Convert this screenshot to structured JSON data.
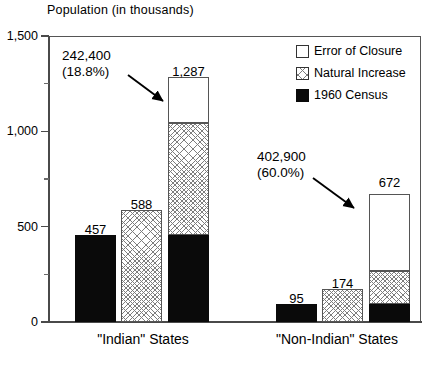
{
  "chart_data": {
    "type": "bar",
    "title": "Population (in thousands)",
    "xlabel": "",
    "ylabel": "Population (in thousands)",
    "ylim": [
      0,
      1500
    ],
    "yticks": [
      0,
      500,
      1000,
      1500
    ],
    "ytick_labels": [
      "0",
      "500",
      "1,000",
      "1,500"
    ],
    "yminor_ticks": [
      250,
      750,
      1250
    ],
    "grid": false,
    "legend_position": "top-right",
    "categories": [
      "\"Indian\" States",
      "\"Non-Indian\" States"
    ],
    "legend": [
      {
        "label": "Error of Closure",
        "pattern": "white"
      },
      {
        "label": "Natural Increase",
        "pattern": "crosshatch"
      },
      {
        "label": "1960 Census",
        "pattern": "black"
      }
    ],
    "groups": [
      {
        "category": "\"Indian\" States",
        "bars": [
          {
            "name": "1960 Census",
            "value": 457,
            "label": "457",
            "pattern": "black"
          },
          {
            "name": "Natural Increase",
            "value": 588,
            "label": "588",
            "pattern": "crosshatch"
          },
          {
            "name": "Stacked Total",
            "value": 1287,
            "label": "1,287",
            "pattern": "stacked",
            "segments": [
              {
                "name": "1960 Census",
                "value": 457,
                "pattern": "black"
              },
              {
                "name": "Natural Increase",
                "value": 588,
                "pattern": "crosshatch"
              },
              {
                "name": "Error of Closure",
                "value": 242,
                "pattern": "white"
              }
            ]
          }
        ],
        "annotation": {
          "line1": "242,400",
          "line2": "(18.8%)",
          "points_to": "Error of Closure"
        }
      },
      {
        "category": "\"Non-Indian\" States",
        "bars": [
          {
            "name": "1960 Census",
            "value": 95,
            "label": "95",
            "pattern": "black"
          },
          {
            "name": "Natural Increase",
            "value": 174,
            "label": "174",
            "pattern": "crosshatch"
          },
          {
            "name": "Stacked Total",
            "value": 672,
            "label": "672",
            "pattern": "stacked",
            "segments": [
              {
                "name": "1960 Census",
                "value": 95,
                "pattern": "black"
              },
              {
                "name": "Natural Increase",
                "value": 174,
                "pattern": "crosshatch"
              },
              {
                "name": "Error of Closure",
                "value": 403,
                "pattern": "white"
              }
            ]
          }
        ],
        "annotation": {
          "line1": "402,900",
          "line2": "(60.0%)",
          "points_to": "Error of Closure"
        }
      }
    ],
    "colors": {
      "census": "#0a0a0a",
      "natural_increase_hatch": "#7d7d7d",
      "error_of_closure": "#ffffff",
      "axis": "#4a4a4a",
      "text": "#000000"
    }
  }
}
